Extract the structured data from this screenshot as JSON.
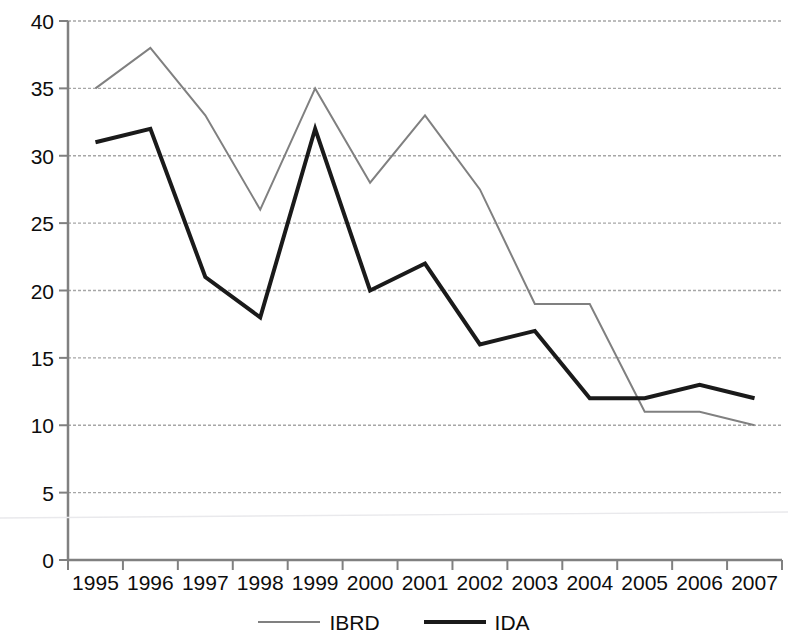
{
  "chart_data": {
    "type": "line",
    "title": "",
    "subtitle": "",
    "xlabel": "",
    "ylabel": "",
    "categories": [
      "1995",
      "1996",
      "1997",
      "1998",
      "1999",
      "2000",
      "2001",
      "2002",
      "2003",
      "2004",
      "2005",
      "2006",
      "2007"
    ],
    "series": [
      {
        "name": "IBRD",
        "color": "#808080",
        "line_width": 2,
        "values": [
          35,
          38,
          33,
          26,
          35,
          28,
          33,
          27.5,
          19,
          19,
          11,
          11,
          10
        ]
      },
      {
        "name": "IDA",
        "color": "#1a1a1a",
        "line_width": 4,
        "values": [
          31,
          32,
          21,
          18,
          32,
          20,
          22,
          16,
          17,
          12,
          12,
          13,
          12
        ]
      }
    ],
    "ylim": [
      0,
      40
    ],
    "y_ticks": [
      0,
      5,
      10,
      15,
      20,
      25,
      30,
      35,
      40
    ],
    "y_tick_labels": [
      "0",
      "5",
      "10",
      "15",
      "20",
      "25",
      "30",
      "35",
      "40"
    ],
    "grid": true,
    "grid_axis": "y",
    "grid_color": "#a6a6a6",
    "axis_color": "#808080",
    "legend_position": "bottom",
    "legend_entries": [
      "IBRD",
      "IDA"
    ]
  },
  "legend": {
    "ibrd_label": "IBRD",
    "ida_label": "IDA"
  }
}
